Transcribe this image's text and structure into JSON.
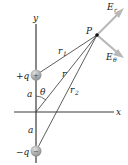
{
  "diagram": {
    "axes": {
      "x_label": "x",
      "y_label": "y"
    },
    "point": {
      "label": "P"
    },
    "charges": {
      "positive": {
        "label": "+q",
        "symbol": "+"
      },
      "negative": {
        "label": "−q",
        "symbol": "−"
      }
    },
    "distances": {
      "r": "r",
      "r1": "r",
      "r1_sub": "1",
      "r2": "r",
      "r2_sub": "2",
      "a_top": "a",
      "a_bottom": "a"
    },
    "angle": {
      "label": "θ"
    },
    "vectors": {
      "E_r": {
        "main": "E",
        "sub": "r"
      },
      "E_theta": {
        "main": "E",
        "sub": "θ"
      }
    },
    "colors": {
      "axis": "#3a3a3a",
      "line": "#333333",
      "vector": "#b8b8b8",
      "charge_fill": "#9a9a9a",
      "charge_highlight": "#d8d8d8"
    }
  }
}
